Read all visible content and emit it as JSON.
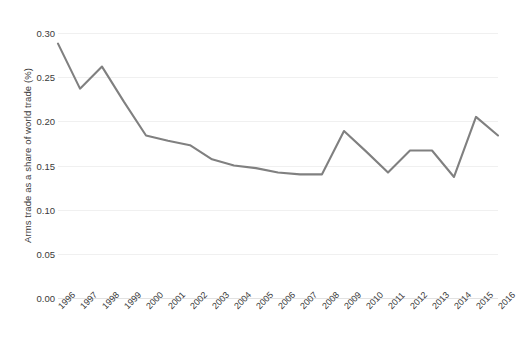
{
  "chart_data": {
    "type": "line",
    "title": "",
    "xlabel": "",
    "ylabel": "Arms  trade as a share of world trade (%)",
    "ylim": [
      0.0,
      0.3
    ],
    "xlim": [
      1996,
      2016
    ],
    "grid": true,
    "legend": "none",
    "line_color": "#808080",
    "categories": [
      "1996",
      "1997",
      "1998",
      "1999",
      "2000",
      "2001",
      "2002",
      "2003",
      "2004",
      "2005",
      "2006",
      "2007",
      "2008",
      "2009",
      "2010",
      "2011",
      "2012",
      "2013",
      "2014",
      "2015",
      "2016"
    ],
    "values": [
      0.288,
      0.237,
      0.262,
      0.222,
      0.184,
      0.178,
      0.173,
      0.157,
      0.15,
      0.147,
      0.142,
      0.14,
      0.14,
      0.189,
      0.166,
      0.142,
      0.167,
      0.167,
      0.137,
      0.205,
      0.184
    ],
    "ytick_labels": [
      "0.30",
      "0.25",
      "0.20",
      "0.15",
      "0.10",
      "0.05",
      "0.00"
    ],
    "ytick_values": [
      0.3,
      0.25,
      0.2,
      0.15,
      0.1,
      0.05,
      0.0
    ],
    "xtick_labels": [
      "1996",
      "1997",
      "1998",
      "1999",
      "2000",
      "2001",
      "2002",
      "2003",
      "2004",
      "2005",
      "2006",
      "2007",
      "2008",
      "2009",
      "2010",
      "2011",
      "2012",
      "2013",
      "2014",
      "2015",
      "2016"
    ]
  }
}
